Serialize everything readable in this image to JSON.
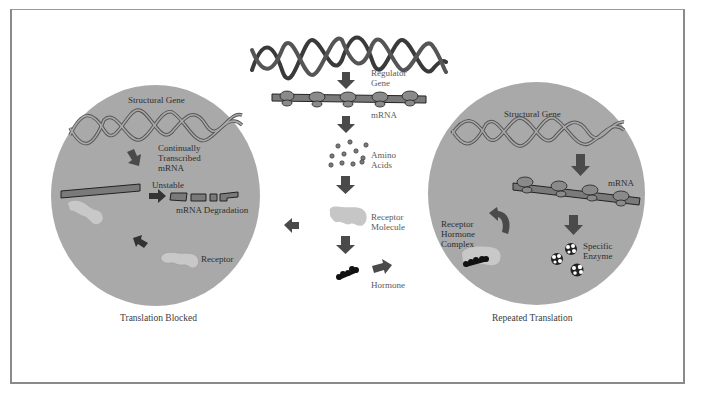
{
  "diagram": {
    "center_column": {
      "regulator_gene_label": [
        "Regulator",
        "Gene"
      ],
      "mrna_label": "mRNA",
      "amino_acids_label": [
        "Amino",
        "Acids"
      ],
      "receptor_molecule_label": [
        "Receptor",
        "Molecule"
      ],
      "hormone_label": "Hormone"
    },
    "left_panel": {
      "structural_gene_label": "Structural Gene",
      "transcribed_label": [
        "Continually",
        "Transcribed",
        "mRNA"
      ],
      "unstable_label": "Unstable",
      "degradation_label": "mRNA Degradation",
      "receptor_label": "Receptor",
      "caption": "Translation Blocked"
    },
    "right_panel": {
      "structural_gene_label": "Structural Gene",
      "mrna_label": "mRNA",
      "complex_label": [
        "Receptor",
        "Hormone",
        "Complex"
      ],
      "enzyme_label": [
        "Specific",
        "Enzyme"
      ],
      "caption": "Repeated Translation"
    },
    "colors": {
      "circle_fill": "#a9a9a9",
      "arrow": "#4a4a4a",
      "dna_stroke": "#3a3a3a",
      "mrna_fill": "#7a7a7a",
      "receptor_fill": "#c8c8c8",
      "hormone": "#111111",
      "frame": "#8a8a8a"
    }
  }
}
